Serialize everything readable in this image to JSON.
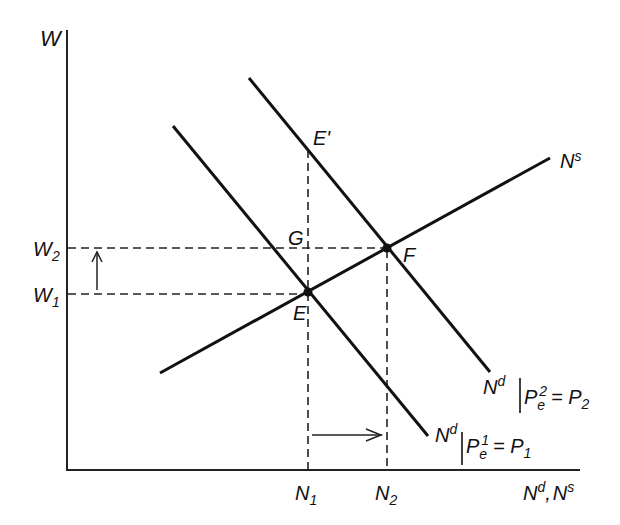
{
  "diagram": {
    "type": "labor-market-supply-demand",
    "axes": {
      "y_label": "W",
      "x_label": "N^d, N^s",
      "x_label_parts": {
        "n1": "N",
        "s1": "d",
        "sep": ",",
        "n2": "N",
        "s2": "s"
      }
    },
    "wage_levels": [
      {
        "id": "W2",
        "base": "W",
        "sub": "2"
      },
      {
        "id": "W1",
        "base": "W",
        "sub": "1"
      }
    ],
    "employment_levels": [
      {
        "id": "N1",
        "base": "N",
        "sub": "1"
      },
      {
        "id": "N2",
        "base": "N",
        "sub": "2"
      }
    ],
    "points": {
      "E": "E",
      "E_prime": "E'",
      "F": "F",
      "G": "G"
    },
    "curves": {
      "supply": {
        "base": "N",
        "sup": "s"
      },
      "demand_1": {
        "base": "N",
        "sup": "d",
        "cond": "P",
        "cond_sub": "e",
        "cond_sup": "1",
        "eq": "= P",
        "eq_sub": "1"
      },
      "demand_2": {
        "base": "N",
        "sup": "d",
        "cond": "P",
        "cond_sub": "e",
        "cond_sup": "2",
        "eq": "= P",
        "eq_sub": "2"
      }
    },
    "arrows": {
      "wage_shift": "up",
      "employment_shift": "right"
    }
  }
}
